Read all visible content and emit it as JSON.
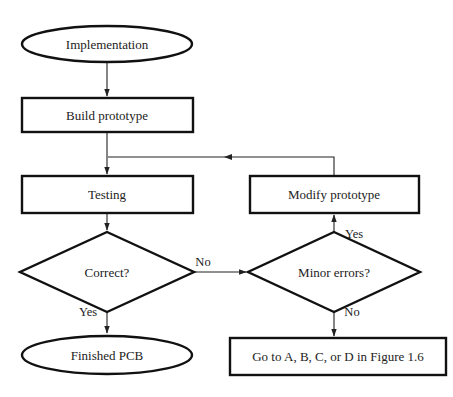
{
  "diagram": {
    "type": "flowchart",
    "nodes": {
      "implementation": {
        "shape": "ellipse",
        "label": "Implementation"
      },
      "build_prototype": {
        "shape": "rectangle",
        "label": "Build prototype"
      },
      "testing": {
        "shape": "rectangle",
        "label": "Testing"
      },
      "modify_prototype": {
        "shape": "rectangle",
        "label": "Modify prototype"
      },
      "correct": {
        "shape": "diamond",
        "label": "Correct?"
      },
      "minor_errors": {
        "shape": "diamond",
        "label": "Minor errors?"
      },
      "finished_pcb": {
        "shape": "ellipse",
        "label": "Finished PCB"
      },
      "go_to": {
        "shape": "rectangle",
        "label": "Go to A, B, C, or D in Figure 1.6"
      }
    },
    "edges": {
      "correct_no": {
        "from": "Correct?",
        "to": "Minor errors?",
        "label": "No"
      },
      "correct_yes": {
        "from": "Correct?",
        "to": "Finished PCB",
        "label": "Yes"
      },
      "minor_yes": {
        "from": "Minor errors?",
        "to": "Modify prototype",
        "label": "Yes"
      },
      "minor_no": {
        "from": "Minor errors?",
        "to": "Go to A, B, C, or D in Figure 1.6",
        "label": "No"
      },
      "impl_build": {
        "from": "Implementation",
        "to": "Build prototype",
        "label": ""
      },
      "build_testing": {
        "from": "Build prototype",
        "to": "Testing",
        "label": ""
      },
      "testing_correct": {
        "from": "Testing",
        "to": "Correct?",
        "label": ""
      },
      "modify_loop": {
        "from": "Modify prototype",
        "to": "Testing",
        "label": ""
      }
    }
  }
}
